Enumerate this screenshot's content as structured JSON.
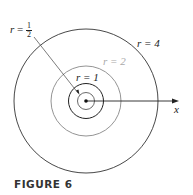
{
  "figure": {
    "caption": "FIGURE 6",
    "axis_label": "x",
    "labels": {
      "half": {
        "var": "r",
        "eq": "=",
        "num": "1",
        "den": "2"
      },
      "one": "r = 1",
      "two": "r = 2",
      "four": "r = 4"
    },
    "colors": {
      "ink": "#222222",
      "gray": "#999999"
    }
  }
}
